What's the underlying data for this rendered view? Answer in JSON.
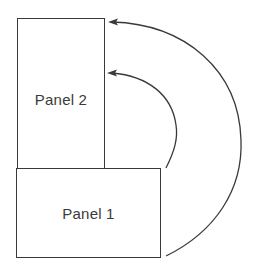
{
  "diagram": {
    "panels": [
      {
        "id": "panel-1",
        "label": "Panel 1"
      },
      {
        "id": "panel-2",
        "label": "Panel 2"
      }
    ],
    "arrows": [
      {
        "name": "outer-arrow",
        "from": "Panel 1 (bottom-right)",
        "to": "Panel 2 (top-right)"
      },
      {
        "name": "inner-arrow",
        "from": "Panel 1 (top-right)",
        "to": "Panel 2 (right, mid-upper)"
      }
    ],
    "colors": {
      "stroke": "#3a3a3a",
      "text": "#3a3a3a",
      "background": "#ffffff"
    }
  }
}
